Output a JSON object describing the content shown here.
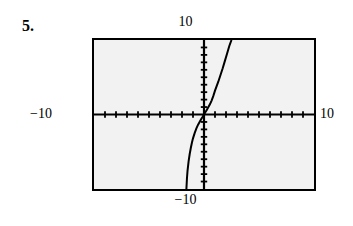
{
  "problem": {
    "number_label": "5."
  },
  "labels": {
    "top": "10",
    "bottom": "−10",
    "left": "−10",
    "right": "10"
  },
  "colors": {
    "screen_background": "#f2f2f2",
    "frame": "#000000",
    "axis": "#000000",
    "curve": "#000000",
    "page_background": "#ffffff"
  },
  "chart_data": {
    "type": "line",
    "title": "",
    "subtitle": "",
    "xlabel": "",
    "ylabel": "",
    "xlim": [
      -10,
      10
    ],
    "ylim": [
      -10,
      10
    ],
    "grid": false,
    "legend": false,
    "legend_position": "none",
    "axis_style": "calculator-screen-with-tick-marks",
    "x_tick_count_per_side": 10,
    "x_tick_spacing": 1,
    "y_tick_count_per_side": 10,
    "y_tick_spacing": 1,
    "tick_labels_shown": false,
    "window_labels": {
      "xmin": "−10",
      "xmax": "10",
      "ymin": "−10",
      "ymax": "10"
    },
    "series": [
      {
        "name": "curve",
        "description": "steep increasing S-shaped cube-root-like curve through the origin",
        "x": [
          -1.6,
          -1.55,
          -1.5,
          -1.4,
          -1.3,
          -1.2,
          -1.1,
          -1.0,
          -0.85,
          -0.7,
          -0.55,
          -0.4,
          -0.25,
          -0.12,
          0.0,
          0.12,
          0.25,
          0.4,
          0.55,
          0.7,
          0.85,
          1.0,
          1.15,
          1.3,
          1.5,
          1.7,
          1.9,
          2.1,
          2.3,
          2.5
        ],
        "y": [
          -10.0,
          -8.6,
          -7.6,
          -6.3,
          -5.3,
          -4.5,
          -3.8,
          -3.2,
          -2.5,
          -1.9,
          -1.4,
          -1.0,
          -0.6,
          -0.3,
          0.0,
          0.3,
          0.6,
          1.0,
          1.4,
          1.9,
          2.5,
          3.2,
          3.8,
          4.4,
          5.3,
          6.2,
          7.2,
          8.2,
          9.2,
          10.0
        ]
      }
    ]
  }
}
